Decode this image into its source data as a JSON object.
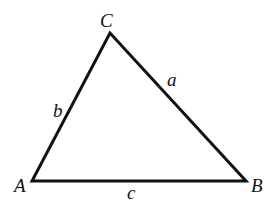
{
  "diagram": {
    "type": "triangle",
    "stroke_color": "#111111",
    "stroke_width": 3,
    "vertices": {
      "A": {
        "label": "A",
        "x": 32,
        "y": 181
      },
      "B": {
        "label": "B",
        "x": 246,
        "y": 181
      },
      "C": {
        "label": "C",
        "x": 110,
        "y": 33
      }
    },
    "sides": {
      "a": {
        "label": "a",
        "from": "B",
        "to": "C"
      },
      "b": {
        "label": "b",
        "from": "A",
        "to": "C"
      },
      "c": {
        "label": "c",
        "from": "A",
        "to": "B"
      }
    }
  }
}
